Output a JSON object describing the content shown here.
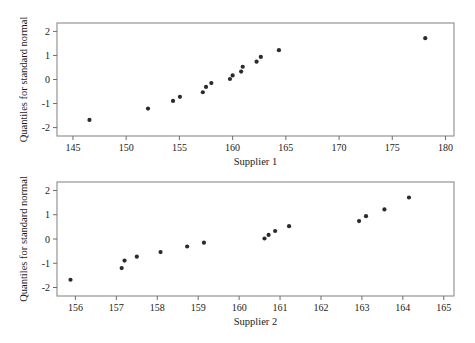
{
  "chart_data": [
    {
      "type": "scatter",
      "title": "",
      "xlabel": "Supplier 1",
      "ylabel": "Quantiles for standard normal",
      "xlim": [
        143.5,
        180.8
      ],
      "ylim": [
        -2.35,
        2.35
      ],
      "xticks": [
        145,
        150,
        155,
        160,
        165,
        170,
        175,
        180
      ],
      "xtick_labels": [
        "145",
        "150",
        "155",
        "160",
        "165",
        "170",
        "175",
        "180"
      ],
      "yticks": [
        2,
        1,
        0,
        -1,
        -2
      ],
      "ytick_labels": [
        "2",
        "1",
        "0",
        "-1",
        "-2"
      ],
      "grid": false,
      "legend": "none",
      "marker": "filled-circle",
      "marker_color": "#2b2b2b",
      "points": [
        {
          "x": 146.55,
          "y": -1.68
        },
        {
          "x": 152.05,
          "y": -1.21
        },
        {
          "x": 154.4,
          "y": -0.89
        },
        {
          "x": 155.05,
          "y": -0.72
        },
        {
          "x": 157.2,
          "y": -0.53
        },
        {
          "x": 157.5,
          "y": -0.31
        },
        {
          "x": 158.0,
          "y": -0.15
        },
        {
          "x": 159.75,
          "y": 0.02
        },
        {
          "x": 160.0,
          "y": 0.17
        },
        {
          "x": 160.8,
          "y": 0.33
        },
        {
          "x": 160.95,
          "y": 0.53
        },
        {
          "x": 162.25,
          "y": 0.74
        },
        {
          "x": 162.65,
          "y": 0.94
        },
        {
          "x": 164.35,
          "y": 1.22
        },
        {
          "x": 178.1,
          "y": 1.72
        }
      ]
    },
    {
      "type": "scatter",
      "title": "",
      "xlabel": "Supplier 2",
      "ylabel": "Quantiles for standard normal",
      "xlim": [
        155.55,
        165.25
      ],
      "ylim": [
        -2.35,
        2.35
      ],
      "xticks": [
        156,
        157,
        158,
        159,
        160,
        161,
        162,
        163,
        164,
        165
      ],
      "xtick_labels": [
        "156",
        "157",
        "158",
        "159",
        "160",
        "161",
        "162",
        "163",
        "164",
        "165"
      ],
      "yticks": [
        2,
        1,
        0,
        -1,
        -2
      ],
      "ytick_labels": [
        "2",
        "1",
        "0",
        "-1",
        "-2"
      ],
      "grid": false,
      "legend": "none",
      "marker": "filled-circle",
      "marker_color": "#2b2b2b",
      "points": [
        {
          "x": 155.88,
          "y": -1.68
        },
        {
          "x": 157.13,
          "y": -1.2
        },
        {
          "x": 157.2,
          "y": -0.89
        },
        {
          "x": 157.5,
          "y": -0.73
        },
        {
          "x": 158.08,
          "y": -0.54
        },
        {
          "x": 158.73,
          "y": -0.31
        },
        {
          "x": 159.14,
          "y": -0.15
        },
        {
          "x": 160.62,
          "y": 0.02
        },
        {
          "x": 160.72,
          "y": 0.17
        },
        {
          "x": 160.88,
          "y": 0.33
        },
        {
          "x": 161.22,
          "y": 0.53
        },
        {
          "x": 162.93,
          "y": 0.74
        },
        {
          "x": 163.1,
          "y": 0.94
        },
        {
          "x": 163.55,
          "y": 1.22
        },
        {
          "x": 164.15,
          "y": 1.71
        }
      ]
    }
  ]
}
